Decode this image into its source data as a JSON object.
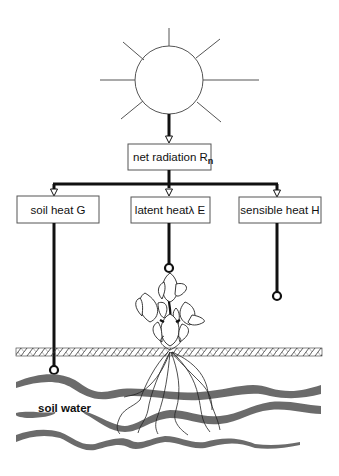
{
  "diagram": {
    "source": {
      "label": "net radiation R",
      "subscript": "n"
    },
    "components": [
      {
        "id": "soil-heat",
        "label": "soil heat G"
      },
      {
        "id": "latent-heat",
        "label": "latent heatλ E"
      },
      {
        "id": "sensible-heat",
        "label": "sensible heat H"
      }
    ],
    "soil_label": "soil water",
    "colors": {
      "line": "#111111",
      "box_border": "#555555",
      "water": "#6b6b6b"
    }
  }
}
